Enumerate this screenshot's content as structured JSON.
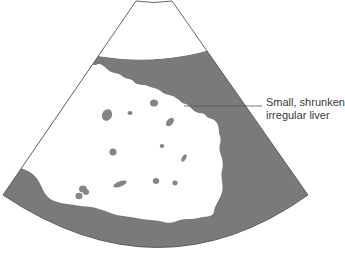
{
  "diagram": {
    "type": "ultrasound-sector-schematic",
    "annotation": {
      "line1": "Small, shrunken",
      "line2": "irregular liver"
    },
    "colors": {
      "background": "#ffffff",
      "tissue_gray": "#7a7a7a",
      "outline": "#555555",
      "label_text": "#3a3a3a"
    }
  }
}
